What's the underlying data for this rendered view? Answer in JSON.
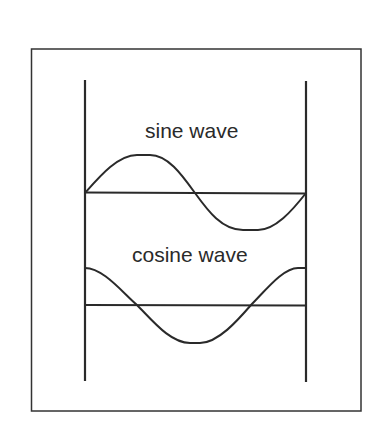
{
  "diagram": {
    "labels": {
      "sine": "sine wave",
      "cosine": "cosine wave"
    },
    "colors": {
      "stroke": "#2a2a2a",
      "background": "#ffffff"
    }
  }
}
